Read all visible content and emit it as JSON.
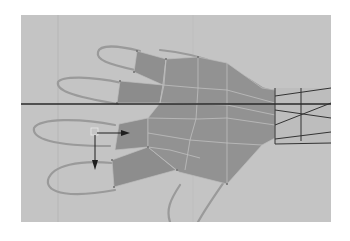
{
  "viewport": {
    "label": "3D modeling viewport",
    "background_color": "#c4c4c4",
    "mesh_fill_color": "#8f8f8f",
    "mesh_edge_color": "#bdbdbd",
    "reference_outline_color": "#9a9a9a",
    "horizon_line_color": "#2a2a2a",
    "wrist_wire_color": "#333333",
    "manipulator_color": "#1e1e1e"
  },
  "scene": {
    "object": "hand polygon mesh",
    "reference_image": "hand outline",
    "tool": "move manipulator",
    "manipulator_axes": [
      "x-axis arrow",
      "y-axis arrow"
    ]
  }
}
